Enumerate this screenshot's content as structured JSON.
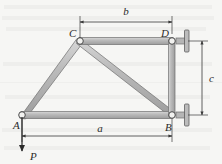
{
  "figure": {
    "type": "truss-free-body-diagram",
    "background_color": "#f7f7f5",
    "member_fill_color": "#b9b9b9",
    "member_stroke_color": "#6e6e6e",
    "line_color": "#3a3a3a"
  },
  "joints": [
    {
      "id": "A",
      "label": "A",
      "x": 22,
      "y": 115,
      "label_x": 13,
      "label_y": 128,
      "support": "none"
    },
    {
      "id": "B",
      "label": "B",
      "x": 172,
      "y": 115,
      "label_x": 166,
      "label_y": 130,
      "support": "pin-wall"
    },
    {
      "id": "C",
      "label": "C",
      "x": 80,
      "y": 41,
      "label_x": 70,
      "label_y": 36,
      "support": "none"
    },
    {
      "id": "D",
      "label": "D",
      "x": 172,
      "y": 41,
      "label_x": 163,
      "label_y": 36,
      "support": "pin-wall"
    }
  ],
  "members": [
    {
      "id": "AB",
      "from": "A",
      "to": "B"
    },
    {
      "id": "AC",
      "from": "A",
      "to": "C"
    },
    {
      "id": "CD",
      "from": "C",
      "to": "D"
    },
    {
      "id": "CB",
      "from": "C",
      "to": "B"
    },
    {
      "id": "DB",
      "from": "D",
      "to": "B"
    }
  ],
  "dimensions": [
    {
      "id": "b",
      "label": "b",
      "orientation": "horizontal",
      "label_x": 126,
      "label_y": 15,
      "line_y": 22,
      "x_start": 80,
      "x_end": 172,
      "ext_from_y": 38,
      "ext_to_y": 18
    },
    {
      "id": "a",
      "label": "a",
      "orientation": "horizontal",
      "label_x": 100,
      "label_y": 131,
      "line_y": 136,
      "x_start": 22,
      "x_end": 172,
      "ext_from_y": 118,
      "ext_to_y": 140
    },
    {
      "id": "c",
      "label": "c",
      "orientation": "vertical",
      "label_x": 207,
      "label_y": 82,
      "line_x": 202,
      "y_start": 41,
      "y_end": 115,
      "ext_from_x": 186,
      "ext_to_x": 206
    }
  ],
  "forces": [
    {
      "id": "P",
      "label": "P",
      "label_x": 30,
      "label_y": 159,
      "x": 22,
      "y_start": 116,
      "y_end": 152,
      "direction": "down"
    }
  ],
  "icons": {
    "pin_joint": "pin-joint-icon",
    "wall_support": "wall-support-icon",
    "force_arrow": "force-arrow-icon",
    "dimension_arrow": "dimension-arrow-icon"
  }
}
